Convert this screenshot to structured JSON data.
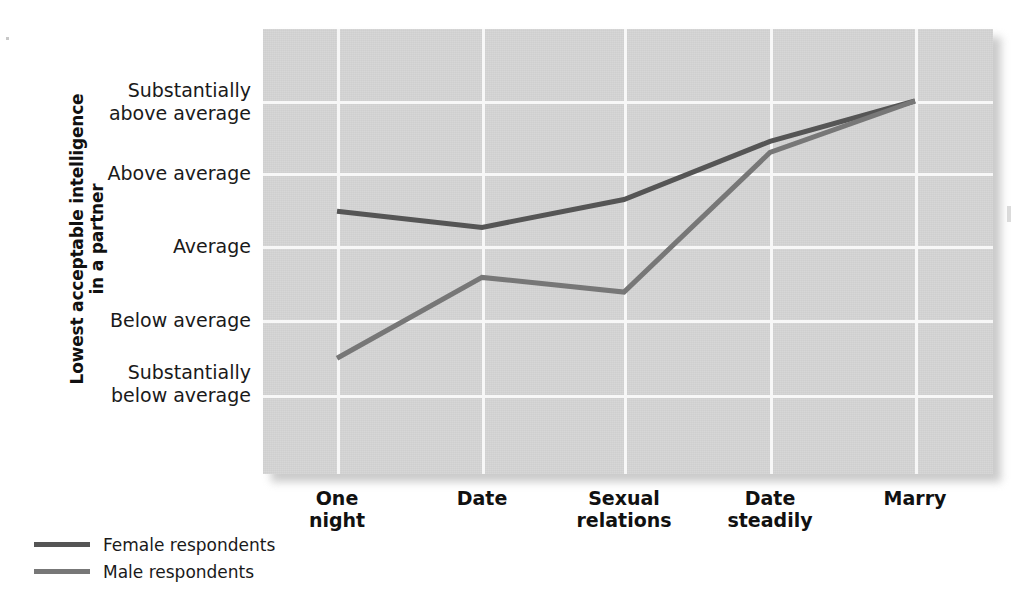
{
  "chart_data": {
    "type": "line",
    "title": "",
    "xlabel": "",
    "ylabel": "Lowest acceptable intelligence in a partner",
    "ylabel_line1": "Lowest acceptable intelligence",
    "ylabel_line2": "in a partner",
    "categories": [
      "One night",
      "Date",
      "Sexual relations",
      "Date steadily",
      "Marry"
    ],
    "category_lines": [
      [
        "One",
        "night"
      ],
      [
        "Date",
        ""
      ],
      [
        "Sexual",
        "relations"
      ],
      [
        "Date",
        "steadily"
      ],
      [
        "Marry",
        ""
      ]
    ],
    "ytick_labels": [
      "Substantially above average",
      "Above average",
      "Average",
      "Below average",
      "Substantially below average"
    ],
    "ytick_lines": [
      [
        "Substantially",
        "above average"
      ],
      [
        "Above average",
        ""
      ],
      [
        "Average",
        ""
      ],
      [
        "Below average",
        ""
      ],
      [
        "Substantially",
        "below average"
      ]
    ],
    "ytick_values": [
      5,
      4,
      3,
      2,
      1
    ],
    "ylim": [
      0.28,
      5.45
    ],
    "grid": true,
    "legend_position": "bottom-left",
    "series": [
      {
        "name": "Female respondents",
        "color": "#555555",
        "values": [
          3.5,
          3.28,
          3.66,
          4.45,
          5.0
        ]
      },
      {
        "name": "Male respondents",
        "color": "#777777",
        "values": [
          1.5,
          2.6,
          2.4,
          4.3,
          5.0
        ]
      }
    ],
    "plot_background": "#d2d2d2",
    "gridline_color": "#f7f7f7"
  },
  "legend": {
    "items": [
      {
        "label": "Female respondents",
        "color": "#555555"
      },
      {
        "label": "Male respondents",
        "color": "#777777"
      }
    ]
  }
}
